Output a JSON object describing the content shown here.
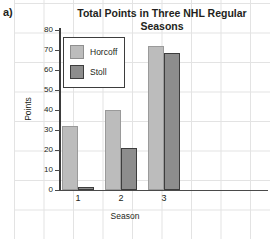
{
  "panel": {
    "label": "a)"
  },
  "chart_data": {
    "type": "bar",
    "title": "Total Points in Three NHL Regular Seasons",
    "xlabel": "Season",
    "ylabel": "Points",
    "categories": [
      "1",
      "2",
      "3"
    ],
    "series": [
      {
        "name": "Horcoff",
        "values": [
          32,
          40,
          72
        ],
        "color": "#bcbcbc"
      },
      {
        "name": "Stoll",
        "values": [
          1.5,
          21,
          68.5
        ],
        "color": "#8d8d8d"
      }
    ],
    "ylim": [
      0,
      80
    ],
    "yticks": [
      0,
      10,
      20,
      30,
      40,
      50,
      60,
      70,
      80
    ],
    "ytick_labels": [
      "0",
      "10",
      "20",
      "30",
      "40",
      "50",
      "60",
      "70",
      "80"
    ],
    "grid": true,
    "legend_position": "upper-left"
  }
}
